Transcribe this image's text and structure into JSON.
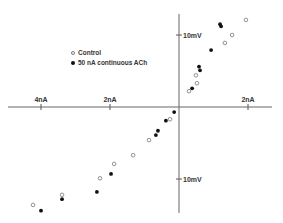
{
  "chart_data": {
    "type": "scatter",
    "title": "",
    "xlabel": "Current (nA)",
    "ylabel": "Voltage (mV)",
    "x_ticks": [
      {
        "value": -4,
        "label": "4nA"
      },
      {
        "value": -2,
        "label": "2nA"
      },
      {
        "value": 2,
        "label": "2nA"
      }
    ],
    "y_ticks": [
      {
        "value": 10,
        "label": "10mV"
      },
      {
        "value": -10,
        "label": "10mV"
      }
    ],
    "xlim": [
      -5.0,
      2.7
    ],
    "ylim": [
      -14.8,
      13.0
    ],
    "grid": false,
    "legend_position": "upper-left-center",
    "series": [
      {
        "name": "Control",
        "marker": "open-circle",
        "color": "#777777",
        "points": [
          [
            1.94,
            12.1
          ],
          [
            1.54,
            10.0
          ],
          [
            1.33,
            8.9
          ],
          [
            0.49,
            4.4
          ],
          [
            0.52,
            3.3
          ],
          [
            0.29,
            2.2
          ],
          [
            -0.26,
            -1.7
          ],
          [
            -0.87,
            -4.6
          ],
          [
            -1.33,
            -6.7
          ],
          [
            -1.88,
            -7.9
          ],
          [
            -2.29,
            -9.9
          ],
          [
            -3.39,
            -12.2
          ],
          [
            -4.23,
            -13.6
          ]
        ]
      },
      {
        "name": "50 nA continuous ACh",
        "marker": "filled-circle",
        "color": "#111111",
        "points": [
          [
            1.19,
            11.5
          ],
          [
            1.22,
            11.2
          ],
          [
            0.93,
            7.9
          ],
          [
            0.58,
            5.6
          ],
          [
            0.61,
            5.1
          ],
          [
            0.38,
            2.6
          ],
          [
            -0.14,
            -0.7
          ],
          [
            -0.38,
            -1.9
          ],
          [
            -0.61,
            -3.3
          ],
          [
            -0.67,
            -3.9
          ],
          [
            -1.97,
            -9.3
          ],
          [
            -2.38,
            -11.8
          ],
          [
            -3.39,
            -12.8
          ],
          [
            -4.0,
            -14.4
          ]
        ]
      }
    ]
  },
  "legend": {
    "items": [
      {
        "label": "Control"
      },
      {
        "label": "50 nA continuous ACh"
      }
    ]
  }
}
